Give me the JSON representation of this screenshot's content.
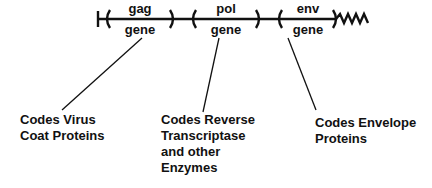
{
  "genes": [
    {
      "name": "gag",
      "label": "gene",
      "caption": "Codes Virus\nCoat Proteins"
    },
    {
      "name": "pol",
      "label": "gene",
      "caption": "Codes Reverse\nTranscriptase\nand other\nEnzymes"
    },
    {
      "name": "env",
      "label": "gene",
      "caption": "Codes Envelope\nProteins"
    }
  ]
}
